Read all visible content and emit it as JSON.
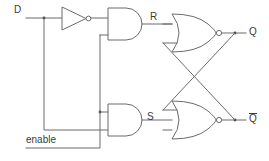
{
  "diagram": {
    "type": "logic-circuit-schematic",
    "background_color": "#ffffff",
    "line_color": "#6b6b6b",
    "text_color": "#3a3a3a"
  },
  "labels": {
    "input_d": "D",
    "input_enable": "enable",
    "signal_r": "R",
    "signal_s": "S",
    "output_q": "Q",
    "output_qbar": "Q",
    "output_qbar_overbar": true
  },
  "gates": [
    {
      "id": "not-gate",
      "kind": "NOT",
      "inputs": [
        "D"
      ],
      "output": "D_inverted"
    },
    {
      "id": "and-gate-top",
      "kind": "AND",
      "inputs": [
        "D_inverted",
        "enable"
      ],
      "output": "R"
    },
    {
      "id": "and-gate-bottom",
      "kind": "AND",
      "inputs": [
        "enable",
        "D"
      ],
      "output": "S"
    },
    {
      "id": "nor-gate-top",
      "kind": "NOR",
      "inputs": [
        "R",
        "Qbar"
      ],
      "output": "Q"
    },
    {
      "id": "nor-gate-bottom",
      "kind": "NOR",
      "inputs": [
        "Q",
        "S"
      ],
      "output": "Qbar"
    }
  ],
  "nets": [
    {
      "id": "net-d",
      "from": "D",
      "to": [
        "not-gate.in",
        "and-gate-bottom.in2"
      ]
    },
    {
      "id": "net-enable",
      "from": "enable",
      "to": [
        "and-gate-top.in2",
        "and-gate-bottom.in1"
      ]
    },
    {
      "id": "net-r",
      "from": "and-gate-top.out",
      "to": [
        "nor-gate-top.in1"
      ]
    },
    {
      "id": "net-s",
      "from": "and-gate-bottom.out",
      "to": [
        "nor-gate-bottom.in2"
      ]
    },
    {
      "id": "net-q",
      "from": "nor-gate-top.out",
      "to": [
        "Q",
        "nor-gate-bottom.in1"
      ]
    },
    {
      "id": "net-qbar",
      "from": "nor-gate-bottom.out",
      "to": [
        "Qbar",
        "nor-gate-top.in2"
      ]
    }
  ]
}
